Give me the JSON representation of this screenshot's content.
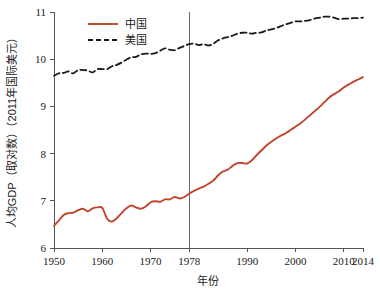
{
  "chart_data": {
    "type": "line",
    "title": "",
    "xlabel": "年份",
    "ylabel": "人均GDP（取对数）（2011年国际美元）",
    "xlim": [
      1950,
      2014
    ],
    "ylim": [
      6,
      11
    ],
    "grid": false,
    "legend_position": "top-left",
    "x_ticks": [
      "1950",
      "1960",
      "1970",
      "1978",
      "1990",
      "2000",
      "2010",
      "2014"
    ],
    "x_tick_values": [
      1950,
      1960,
      1970,
      1978,
      1990,
      2000,
      2010,
      2014
    ],
    "y_ticks": [
      "6",
      "7",
      "8",
      "9",
      "10",
      "11"
    ],
    "y_tick_values": [
      6,
      7,
      8,
      9,
      10,
      11
    ],
    "annotations": [
      {
        "name": "reference-line-1978",
        "type": "vline",
        "x": 1978,
        "color": "#6b6b6b",
        "label": ""
      }
    ],
    "colors": {
      "china_line": "#c1452e",
      "usa_line": "#1a1a1a",
      "axis": "#555555",
      "reference_line": "#6b6b6b",
      "background": "#ffffff"
    },
    "x": [
      1950,
      1951,
      1952,
      1953,
      1954,
      1955,
      1956,
      1957,
      1958,
      1959,
      1960,
      1961,
      1962,
      1963,
      1964,
      1965,
      1966,
      1967,
      1968,
      1969,
      1970,
      1971,
      1972,
      1973,
      1974,
      1975,
      1976,
      1977,
      1978,
      1979,
      1980,
      1981,
      1982,
      1983,
      1984,
      1985,
      1986,
      1987,
      1988,
      1989,
      1990,
      1991,
      1992,
      1993,
      1994,
      1995,
      1996,
      1997,
      1998,
      1999,
      2000,
      2001,
      2002,
      2003,
      2004,
      2005,
      2006,
      2007,
      2008,
      2009,
      2010,
      2011,
      2012,
      2013,
      2014
    ],
    "series": [
      {
        "name": "中国",
        "label": "中国",
        "color": "#c1452e",
        "style": "solid",
        "values": [
          6.47,
          6.58,
          6.7,
          6.74,
          6.75,
          6.8,
          6.83,
          6.78,
          6.84,
          6.86,
          6.85,
          6.62,
          6.56,
          6.63,
          6.74,
          6.84,
          6.9,
          6.86,
          6.83,
          6.88,
          6.97,
          6.99,
          6.98,
          7.03,
          7.03,
          7.08,
          7.05,
          7.08,
          7.15,
          7.21,
          7.26,
          7.3,
          7.36,
          7.43,
          7.54,
          7.62,
          7.66,
          7.74,
          7.8,
          7.8,
          7.79,
          7.86,
          7.97,
          8.07,
          8.17,
          8.25,
          8.32,
          8.38,
          8.43,
          8.5,
          8.57,
          8.64,
          8.72,
          8.81,
          8.9,
          8.99,
          9.09,
          9.19,
          9.26,
          9.32,
          9.4,
          9.46,
          9.52,
          9.57,
          9.62
        ]
      },
      {
        "name": "美国",
        "label": "美国",
        "color": "#1a1a1a",
        "style": "dashed",
        "values": [
          9.65,
          9.7,
          9.71,
          9.74,
          9.7,
          9.77,
          9.77,
          9.76,
          9.72,
          9.79,
          9.79,
          9.79,
          9.85,
          9.88,
          9.93,
          9.99,
          10.04,
          10.05,
          10.1,
          10.12,
          10.11,
          10.13,
          10.18,
          10.23,
          10.2,
          10.19,
          10.24,
          10.28,
          10.32,
          10.33,
          10.3,
          10.32,
          10.29,
          10.33,
          10.4,
          10.44,
          10.47,
          10.5,
          10.54,
          10.56,
          10.56,
          10.54,
          10.56,
          10.57,
          10.61,
          10.63,
          10.66,
          10.7,
          10.74,
          10.77,
          10.8,
          10.8,
          10.81,
          10.83,
          10.86,
          10.88,
          10.9,
          10.9,
          10.88,
          10.85,
          10.86,
          10.86,
          10.87,
          10.87,
          10.88
        ]
      }
    ]
  },
  "legend": {
    "items": [
      {
        "label": "中国",
        "style": "solid",
        "color": "#c1452e"
      },
      {
        "label": "美国",
        "style": "dashed",
        "color": "#1a1a1a"
      }
    ]
  },
  "axes": {
    "x_title": "年份",
    "y_title": "人均GDP（取对数）（2011年国际美元）"
  }
}
